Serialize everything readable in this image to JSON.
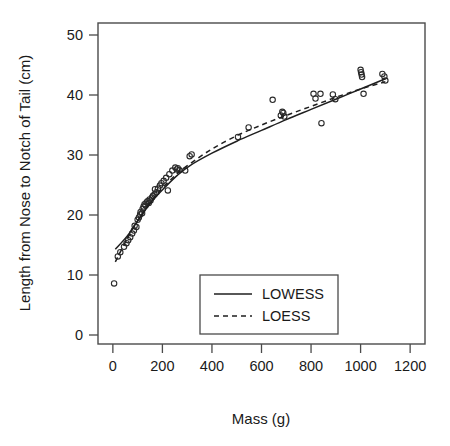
{
  "chart_data": {
    "type": "scatter",
    "title": "",
    "xlabel": "Mass (g)",
    "ylabel": "Length from Nose to Notch of Tail (cm)",
    "xlim": [
      -60,
      1260
    ],
    "ylim": [
      -1.5,
      52
    ],
    "xticks": [
      0,
      200,
      400,
      600,
      800,
      1000,
      1200
    ],
    "yticks": [
      0,
      10,
      20,
      30,
      40,
      50
    ],
    "xtick_labels": [
      "0",
      "200",
      "400",
      "600",
      "800",
      "1000",
      "1200"
    ],
    "ytick_labels": [
      "0",
      "10",
      "20",
      "30",
      "40",
      "50"
    ],
    "grid": false,
    "legend_position": "bottom-center",
    "legend": [
      {
        "label": "LOWESS",
        "style": "solid"
      },
      {
        "label": "LOESS",
        "style": "dashed"
      }
    ],
    "point_marker": "open-circle",
    "point_color": "#2b2b2b",
    "points": [
      [
        5,
        8.6
      ],
      [
        20,
        13.1
      ],
      [
        30,
        13.8
      ],
      [
        45,
        14.7
      ],
      [
        55,
        15.3
      ],
      [
        62,
        15.8
      ],
      [
        70,
        16.3
      ],
      [
        78,
        16.9
      ],
      [
        85,
        17.4
      ],
      [
        88,
        18.2
      ],
      [
        95,
        18.0
      ],
      [
        100,
        19.2
      ],
      [
        105,
        19.6
      ],
      [
        110,
        20.1
      ],
      [
        112,
        20.5
      ],
      [
        118,
        20.3
      ],
      [
        120,
        21.0
      ],
      [
        124,
        21.4
      ],
      [
        128,
        21.8
      ],
      [
        132,
        21.6
      ],
      [
        136,
        22.1
      ],
      [
        140,
        22.3
      ],
      [
        145,
        22.0
      ],
      [
        148,
        22.6
      ],
      [
        152,
        22.4
      ],
      [
        158,
        22.9
      ],
      [
        162,
        23.2
      ],
      [
        168,
        23.4
      ],
      [
        170,
        24.3
      ],
      [
        176,
        23.8
      ],
      [
        182,
        24.4
      ],
      [
        190,
        24.9
      ],
      [
        196,
        25.3
      ],
      [
        205,
        25.7
      ],
      [
        215,
        26.2
      ],
      [
        222,
        24.1
      ],
      [
        228,
        26.8
      ],
      [
        240,
        27.4
      ],
      [
        252,
        27.9
      ],
      [
        258,
        27.6
      ],
      [
        262,
        27.8
      ],
      [
        268,
        27.5
      ],
      [
        292,
        27.4
      ],
      [
        310,
        29.8
      ],
      [
        318,
        30.1
      ],
      [
        505,
        33.0
      ],
      [
        548,
        34.6
      ],
      [
        645,
        39.2
      ],
      [
        678,
        36.6
      ],
      [
        684,
        37.2
      ],
      [
        688,
        37.0
      ],
      [
        692,
        36.4
      ],
      [
        810,
        40.2
      ],
      [
        818,
        39.4
      ],
      [
        838,
        40.2
      ],
      [
        842,
        35.3
      ],
      [
        888,
        40.1
      ],
      [
        898,
        39.3
      ],
      [
        1000,
        44.2
      ],
      [
        1002,
        43.8
      ],
      [
        1004,
        43.4
      ],
      [
        1006,
        43.0
      ],
      [
        1012,
        40.2
      ],
      [
        1088,
        43.5
      ],
      [
        1096,
        43.1
      ],
      [
        1100,
        42.4
      ]
    ],
    "series": [
      {
        "name": "LOWESS",
        "style": "solid",
        "x": [
          10,
          60,
          110,
          160,
          210,
          260,
          310,
          400,
          500,
          600,
          700,
          800,
          900,
          1000,
          1100
        ],
        "y": [
          14.3,
          16.6,
          19.6,
          22.4,
          24.6,
          26.6,
          28.2,
          30.3,
          32.3,
          34.1,
          35.9,
          37.6,
          39.3,
          41.0,
          42.7
        ]
      },
      {
        "name": "LOESS",
        "style": "dashed",
        "x": [
          10,
          60,
          110,
          160,
          210,
          260,
          310,
          400,
          500,
          600,
          700,
          800,
          900,
          1000,
          1100
        ],
        "y": [
          12.2,
          16.2,
          19.7,
          22.6,
          24.9,
          26.9,
          28.5,
          31.0,
          33.2,
          35.0,
          36.6,
          38.1,
          39.6,
          41.0,
          42.2
        ]
      }
    ]
  }
}
